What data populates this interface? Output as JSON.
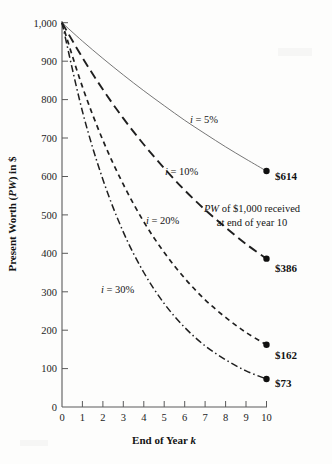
{
  "chart_data": {
    "type": "line",
    "title": "",
    "xlabel": "End of Year k",
    "ylabel": "Present Worth (PW) in $",
    "xlim": [
      0,
      10
    ],
    "ylim": [
      0,
      1000
    ],
    "grid": false,
    "legend_position": "inline-curve-labels",
    "x": [
      0,
      1,
      2,
      3,
      4,
      5,
      6,
      7,
      8,
      9,
      10
    ],
    "series": [
      {
        "name": "i = 5%",
        "rate": 0.05,
        "line_style": "solid",
        "values": [
          1000,
          952,
          907,
          864,
          823,
          784,
          746,
          711,
          677,
          645,
          614
        ],
        "end_value": 614,
        "end_label": "$614"
      },
      {
        "name": "i = 10%",
        "rate": 0.1,
        "line_style": "long-dash",
        "values": [
          1000,
          909,
          826,
          751,
          683,
          621,
          564,
          513,
          467,
          424,
          386
        ],
        "end_value": 386,
        "end_label": "$386"
      },
      {
        "name": "i = 20%",
        "rate": 0.2,
        "line_style": "short-dash",
        "values": [
          1000,
          833,
          694,
          579,
          482,
          402,
          335,
          279,
          233,
          194,
          162
        ],
        "end_value": 162,
        "end_label": "$162"
      },
      {
        "name": "i = 30%",
        "rate": 0.3,
        "line_style": "dash-dot",
        "values": [
          1000,
          769,
          592,
          455,
          350,
          269,
          207,
          159,
          123,
          94,
          73
        ],
        "end_value": 73,
        "end_label": "$73"
      }
    ],
    "yticks": [
      0,
      100,
      200,
      300,
      400,
      500,
      600,
      700,
      800,
      900,
      1000
    ],
    "ytick_labels": [
      "0",
      "100",
      "200",
      "300",
      "400",
      "500",
      "600",
      "700",
      "800",
      "900",
      "1,000"
    ],
    "xticks": [
      0,
      1,
      2,
      3,
      4,
      5,
      6,
      7,
      8,
      9,
      10
    ],
    "xtick_labels": [
      "0",
      "1",
      "2",
      "3",
      "4",
      "5",
      "6",
      "7",
      "8",
      "9",
      "10"
    ],
    "annotations": [
      {
        "name": "pw-note",
        "line1": "PW of $1,000 received",
        "line2": "at end of year 10"
      }
    ]
  },
  "axis": {
    "y_title_parts": {
      "pre": "Present Worth (",
      "italic": "PW",
      "post": ") in $"
    },
    "x_title_parts": {
      "pre": "End of Year ",
      "italic": "k"
    }
  },
  "curve_labels": [
    {
      "italic": "i",
      "rest": " = 5%"
    },
    {
      "italic": "i",
      "rest": " = 10%"
    },
    {
      "italic": "i",
      "rest": " = 20%"
    },
    {
      "italic": "i",
      "rest": " = 30%"
    }
  ],
  "annotation": {
    "italic": "PW",
    "rest_line1": " of $1,000 received",
    "line2": "at end of year 10"
  },
  "colors": {
    "background": "#fdfdfc",
    "axis": "#5a5a5a",
    "curve_dark": "#1f1f1f",
    "curve_light": "#666666",
    "text": "#1a1a1a"
  }
}
